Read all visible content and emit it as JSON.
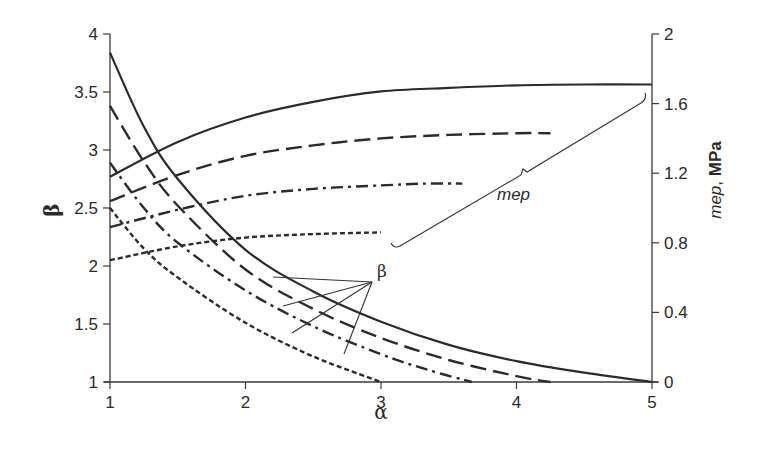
{
  "chart_data": {
    "type": "line",
    "title": "",
    "xlabel": "α",
    "ylabel": "β",
    "ylabel_right": "mep, MPa",
    "xlim": [
      1,
      5
    ],
    "ylim": [
      1,
      4
    ],
    "ylim_right": [
      0,
      2
    ],
    "x_ticks": [
      "1",
      "2",
      "3",
      "4",
      "5"
    ],
    "y_ticks": [
      "1",
      "1.5",
      "2",
      "2.5",
      "3",
      "3.5",
      "4"
    ],
    "y_ticks_right": [
      "0",
      "0.4",
      "0.8",
      "1.2",
      "1.6",
      "2"
    ],
    "grid": false,
    "legend": null,
    "annotations": [
      {
        "text": "β",
        "target": "beta curves (decreasing)",
        "position": [
          3.53,
          2.04
        ]
      },
      {
        "text": "mep",
        "target": "mep curves (increasing, right axis)",
        "position": [
          3.95,
          1.15
        ]
      }
    ],
    "series": [
      {
        "name": "β (solid)",
        "axis": "left",
        "style": "solid",
        "x": [
          1.0,
          1.25,
          1.5,
          2.0,
          2.5,
          3.0,
          3.5,
          4.0,
          4.5,
          5.0
        ],
        "y": [
          3.84,
          3.2,
          2.75,
          2.14,
          1.78,
          1.52,
          1.32,
          1.18,
          1.08,
          1.0
        ]
      },
      {
        "name": "β (long dash)",
        "axis": "left",
        "style": "dash",
        "x": [
          1.0,
          1.25,
          1.5,
          2.0,
          2.5,
          3.0,
          3.5,
          4.0,
          4.25
        ],
        "y": [
          3.38,
          2.9,
          2.52,
          1.97,
          1.63,
          1.38,
          1.19,
          1.05,
          1.0
        ]
      },
      {
        "name": "β (dash-dot)",
        "axis": "left",
        "style": "dashdot",
        "x": [
          1.0,
          1.25,
          1.5,
          2.0,
          2.5,
          3.0,
          3.33,
          3.67
        ],
        "y": [
          2.89,
          2.5,
          2.2,
          1.79,
          1.48,
          1.24,
          1.11,
          1.0
        ]
      },
      {
        "name": "β (dotted)",
        "axis": "left",
        "style": "dot",
        "x": [
          1.0,
          1.25,
          1.5,
          2.0,
          2.5,
          3.0
        ],
        "y": [
          2.5,
          2.15,
          1.9,
          1.51,
          1.22,
          1.0
        ]
      },
      {
        "name": "mep (solid)",
        "axis": "right",
        "style": "solid",
        "x": [
          1.0,
          1.5,
          2.0,
          2.5,
          3.0,
          3.5,
          4.0,
          4.5,
          5.0
        ],
        "y": [
          1.18,
          1.38,
          1.52,
          1.61,
          1.67,
          1.69,
          1.705,
          1.71,
          1.71
        ]
      },
      {
        "name": "mep (long dash)",
        "axis": "right",
        "style": "dash",
        "x": [
          1.0,
          1.5,
          2.0,
          2.5,
          3.0,
          3.5,
          4.0,
          4.25
        ],
        "y": [
          1.04,
          1.19,
          1.3,
          1.36,
          1.4,
          1.42,
          1.43,
          1.43
        ]
      },
      {
        "name": "mep (dash-dot)",
        "axis": "right",
        "style": "dashdot",
        "x": [
          1.0,
          1.5,
          2.0,
          2.5,
          3.0,
          3.33,
          3.6
        ],
        "y": [
          0.89,
          0.99,
          1.07,
          1.11,
          1.13,
          1.14,
          1.14
        ]
      },
      {
        "name": "mep (dotted)",
        "axis": "right",
        "style": "dot",
        "x": [
          1.0,
          1.5,
          2.0,
          2.5,
          3.0
        ],
        "y": [
          0.7,
          0.78,
          0.83,
          0.85,
          0.86
        ]
      }
    ]
  },
  "labels": {
    "x_title": "α",
    "y_title": "β",
    "right_title_italic": "mep",
    "right_title_sep": ", ",
    "right_title_bold": "MPa",
    "beta_annotation": "β",
    "mep_annotation": "mep"
  }
}
